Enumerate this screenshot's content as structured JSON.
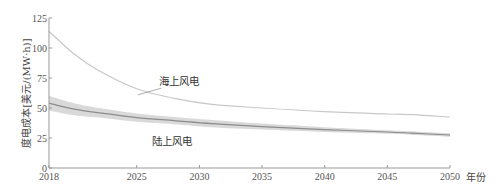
{
  "chart_data": {
    "type": "line",
    "title": "",
    "xlabel": "年份",
    "ylabel": "度电成本[美元/(MW·h)]",
    "xlim": [
      2018,
      2050
    ],
    "ylim": [
      0,
      125
    ],
    "grid": false,
    "legend": "none (inline annotations)",
    "x_ticks": [
      2018,
      2025,
      2030,
      2035,
      2040,
      2045,
      2050
    ],
    "y_ticks": [
      0,
      25,
      50,
      75,
      100,
      125
    ],
    "x": [
      2018,
      2020,
      2022,
      2025,
      2028,
      2031,
      2035,
      2040,
      2045,
      2047,
      2050
    ],
    "series": [
      {
        "name": "海上风电",
        "color": "#c8c8c8",
        "values": [
          114,
          95,
          81,
          66,
          58,
          53,
          50,
          47,
          45,
          44.5,
          42.5
        ]
      },
      {
        "name": "陆上风电",
        "color": "#8c8c8c",
        "values": [
          54,
          49,
          46,
          42,
          39.5,
          37,
          34.5,
          32,
          30,
          29,
          27.5
        ],
        "band_upper": [
          60,
          54,
          50,
          45.5,
          42.5,
          40,
          37,
          34,
          31.5,
          30.5,
          29
        ],
        "band_lower": [
          48,
          44,
          42,
          38.5,
          36.5,
          34,
          32,
          30,
          28.5,
          27.5,
          26
        ],
        "band_color": "#d9d9d9"
      }
    ],
    "annotations": [
      {
        "text": "海上风电",
        "x": 2026.8,
        "y": 69,
        "leader_to": [
          2025.1,
          61
        ]
      },
      {
        "text": "陆上风电",
        "x": 2026.2,
        "y": 19
      }
    ]
  },
  "labels": {
    "xlabel": "年份",
    "ylabel": "度电成本[美元/(MW·h)]",
    "offshore": "海上风电",
    "onshore": "陆上风电"
  }
}
